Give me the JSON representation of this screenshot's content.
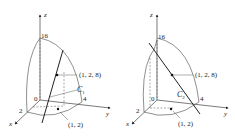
{
  "figures": [
    {
      "id": "left",
      "axes": {
        "x": "x",
        "y": "y",
        "z": "z"
      },
      "ticks": {
        "z": "16",
        "y": "4",
        "x": "2",
        "origin": "0"
      },
      "point_label": "(1, 2, 8)",
      "base_point_label": "(1, 2)",
      "curve_label": "C",
      "curve_subscript": "1"
    },
    {
      "id": "right",
      "axes": {
        "x": "x",
        "y": "y",
        "z": "z"
      },
      "ticks": {
        "z": "16",
        "y": "4",
        "x": "2",
        "origin": "0"
      },
      "point_label": "(1, 2, 8)",
      "base_point_label": "(1, 2)",
      "curve_label": "C",
      "curve_subscript": "2"
    }
  ],
  "colors": {
    "ink": "#222222",
    "dashed": "#555555"
  }
}
